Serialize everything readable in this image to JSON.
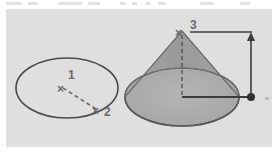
{
  "figure": {
    "title": "",
    "background_color": "#e1e1e1",
    "page_color": "#ffffff",
    "ink_color": "#555555",
    "marker_color": "#6f6f6f",
    "cone_side_color": "#9e9e9e",
    "cone_base_color": "#aeaeae"
  },
  "left_shape": {
    "name": "ellipse-circle-outline",
    "center_marker": {
      "glyph": "x",
      "label": "1"
    },
    "edge_marker": {
      "glyph": "x",
      "label": "2"
    },
    "radius_line_style": "dashed"
  },
  "right_shape": {
    "name": "cone",
    "apex_marker": {
      "glyph": "x",
      "label": "3"
    },
    "axis_line_style": "dashed",
    "radius_arrow": {
      "name": "base-radius-arrow",
      "label": ""
    },
    "height_dimension": {
      "name": "height-dimension-arrow",
      "label": ""
    }
  },
  "annotations": {
    "marker_1": "1",
    "marker_2": "2",
    "marker_3": "3",
    "marker_glyph": "x"
  }
}
